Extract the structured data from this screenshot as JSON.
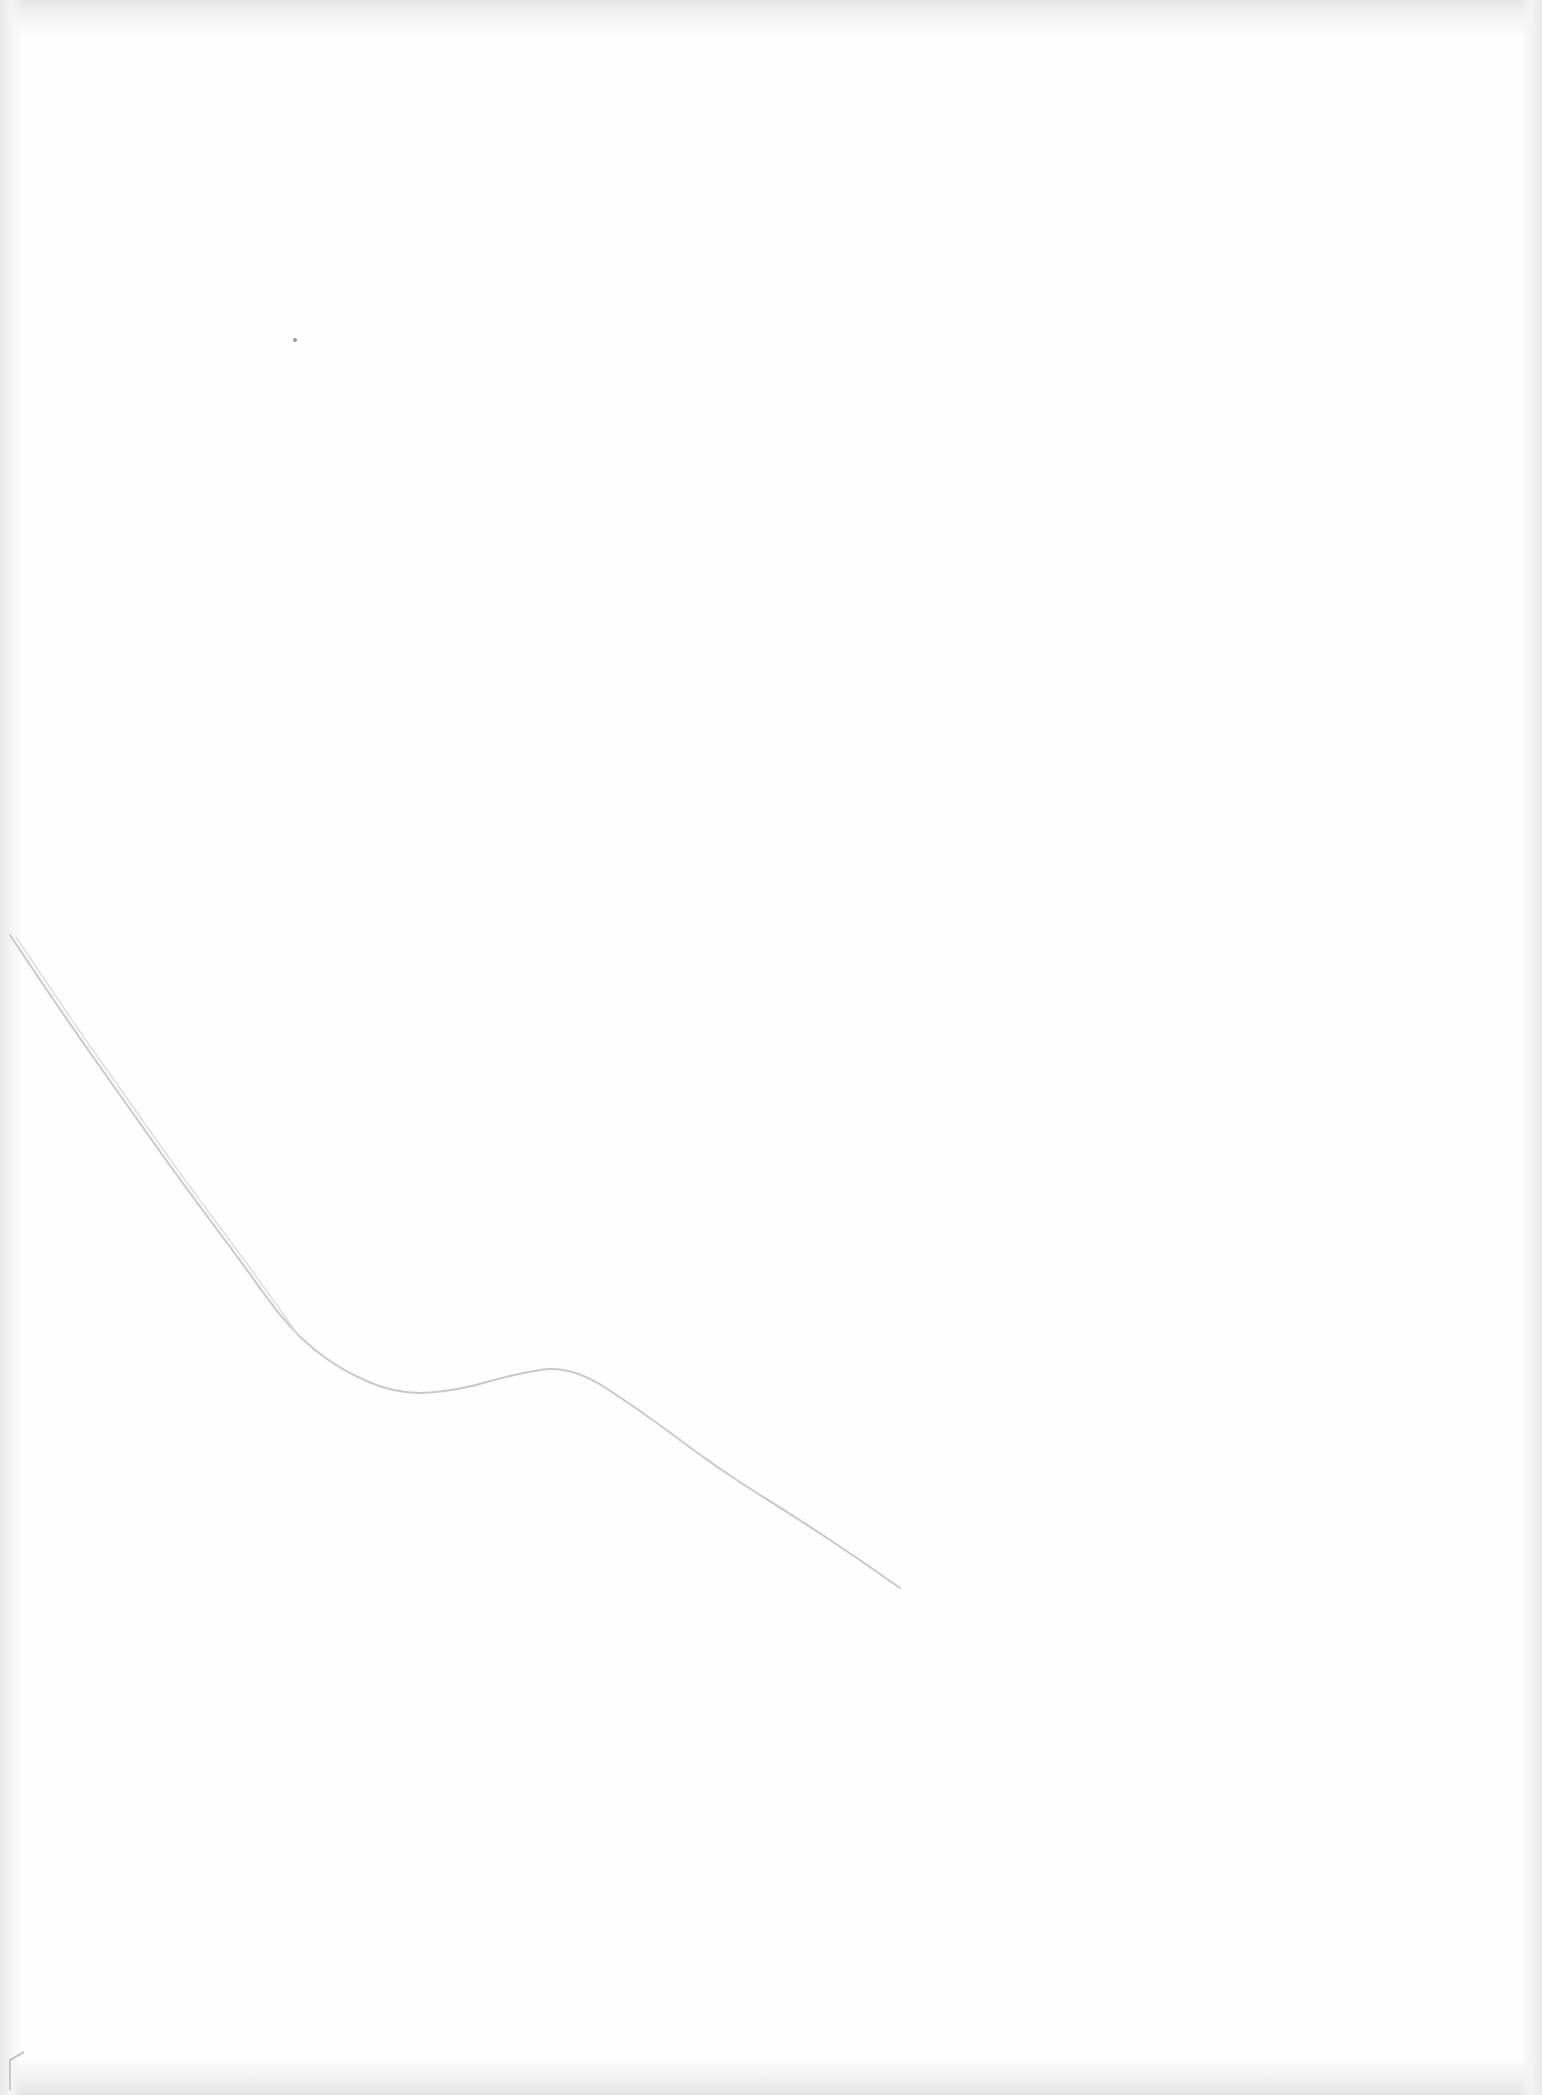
{
  "page": {
    "background": "#fefefe",
    "edge_shadow": "#e6e6e6"
  },
  "drawing": {
    "stroke_color": "#c8c8c8",
    "stroke_dark": "#9a9a9a",
    "pencil_curve_points": [
      [
        10,
        935
      ],
      [
        60,
        1010
      ],
      [
        120,
        1095
      ],
      [
        180,
        1180
      ],
      [
        240,
        1260
      ],
      [
        290,
        1330
      ],
      [
        340,
        1370
      ],
      [
        400,
        1395
      ],
      [
        460,
        1390
      ],
      [
        510,
        1375
      ],
      [
        570,
        1365
      ],
      [
        640,
        1410
      ],
      [
        720,
        1470
      ],
      [
        800,
        1520
      ],
      [
        860,
        1560
      ],
      [
        900,
        1588
      ]
    ],
    "speck": {
      "x": 295,
      "y": 340
    },
    "corner_fold": {
      "x": 10,
      "y": 2060
    }
  }
}
